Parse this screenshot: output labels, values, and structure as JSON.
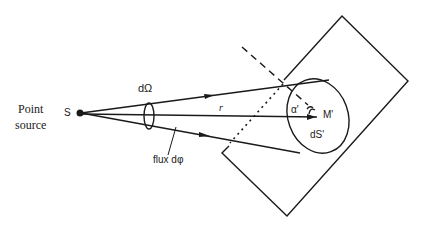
{
  "diagram": {
    "type": "solid-angle-flux-diagram",
    "labels": {
      "point_source_line1": "Point",
      "point_source_line2": "source",
      "source": "S",
      "solid_angle": "dΩ",
      "distance": "r",
      "flux": "flux dφ",
      "angle": "α'",
      "point": "M'",
      "surface_element": "dS'"
    },
    "colors": {
      "stroke": "#1a1a1a",
      "background": "#ffffff"
    }
  }
}
